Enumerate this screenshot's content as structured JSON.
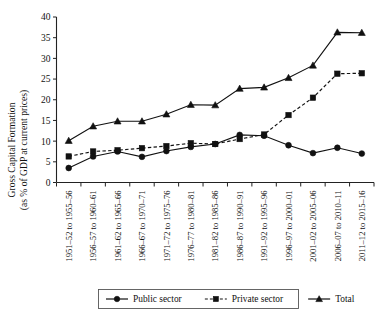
{
  "chart_data": {
    "type": "line",
    "title": "",
    "xlabel": "",
    "ylabel": "Gross Capital Formation (as % of GDP at current prices)",
    "ylabel_line1": "Gross Capital Formation",
    "ylabel_line2": "(as % of GDP at current prices)",
    "ylim": [
      0,
      40
    ],
    "yticks": [
      0,
      5,
      10,
      15,
      20,
      25,
      30,
      35,
      40
    ],
    "ytick_labels": [
      "0",
      "5",
      "10",
      "15",
      "20",
      "25",
      "30",
      "35",
      "40"
    ],
    "grid": false,
    "legend_position": "bottom",
    "categories": [
      "1951–52 to 1955–56",
      "1956–57 to 1960–61",
      "1961–62 to 1965–66",
      "1966–67 to 1970–71",
      "1971–72 to 1975–76",
      "1976–77 to 1980–81",
      "1981–82 to 1985–86",
      "1986–87 to 1990–91",
      "1991–92 to 1995–96",
      "1996–97 to 2000–01",
      "2001–02 to 2005–06",
      "2006–07 to 2010–11",
      "2011–12 to 2015–16"
    ],
    "series": [
      {
        "name": "Public sector",
        "marker": "circle",
        "linestyle": "solid",
        "color": "#111111",
        "values": [
          3.5,
          6.3,
          7.5,
          6.2,
          7.6,
          8.6,
          9.3,
          11.5,
          11.3,
          9.0,
          7.1,
          8.4,
          7.0
        ]
      },
      {
        "name": "Private sector",
        "marker": "square",
        "linestyle": "dashed",
        "color": "#111111",
        "values": [
          6.3,
          7.5,
          7.8,
          8.3,
          8.8,
          9.5,
          9.3,
          10.5,
          11.6,
          16.3,
          20.5,
          26.3,
          26.4
        ]
      },
      {
        "name": "Total",
        "marker": "triangle",
        "linestyle": "solid",
        "color": "#111111",
        "values": [
          10.1,
          13.6,
          14.8,
          14.8,
          16.5,
          18.8,
          18.7,
          22.7,
          23.0,
          25.3,
          28.3,
          36.3,
          36.2
        ]
      }
    ]
  },
  "legend": {
    "items": [
      {
        "label": "Public sector",
        "marker": "circle",
        "linestyle": "solid"
      },
      {
        "label": "Private sector",
        "marker": "square",
        "linestyle": "dashed"
      },
      {
        "label": "Total",
        "marker": "triangle",
        "linestyle": "solid"
      }
    ]
  }
}
